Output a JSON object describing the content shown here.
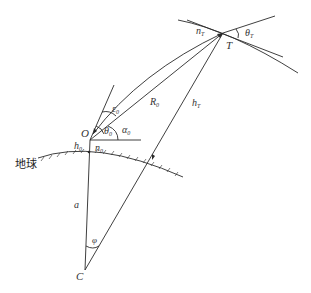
{
  "diagram": {
    "type": "radar/geometry refraction diagram",
    "stroke_color": "#2a2a2a",
    "background": "#ffffff",
    "points": {
      "T": {
        "label": "T",
        "x": 223,
        "y": 33
      },
      "O": {
        "label": "O",
        "x": 90,
        "y": 140
      },
      "C": {
        "label": "C",
        "x": 85,
        "y": 270
      }
    },
    "labels": {
      "n_T": {
        "base": "n",
        "sub": "T"
      },
      "theta_T": {
        "base": "θ",
        "sub": "T"
      },
      "T": "T",
      "R0": {
        "base": "R",
        "sub": "0"
      },
      "hT": {
        "base": "h",
        "sub": "T"
      },
      "eps0": {
        "base": "ε",
        "sub": "0"
      },
      "O": "O",
      "theta0": {
        "base": "θ",
        "sub": "0"
      },
      "alpha0": {
        "base": "α",
        "sub": "0"
      },
      "h0": {
        "base": "h",
        "sub": "0"
      },
      "n0": {
        "base": "n",
        "sub": "0"
      },
      "earth": "地球",
      "a": "a",
      "phi": "φ",
      "C": "C"
    }
  }
}
